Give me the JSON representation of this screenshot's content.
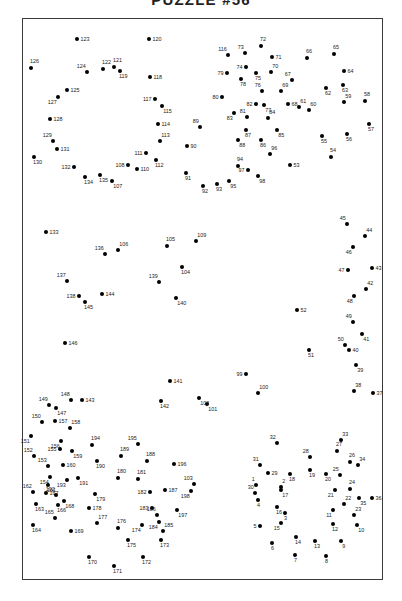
{
  "page": {
    "title": "PUZZLE #56",
    "background_color": "#ffffff",
    "frame_color": "#3a3a3a",
    "dot_color": "#000000",
    "label_color": "#1a1a1a"
  },
  "chart_data": {
    "type": "scatter",
    "title": "PUZZLE #56",
    "xlabel": "",
    "ylabel": "",
    "grid": false,
    "legend": null,
    "xlim": [
      22,
      383
    ],
    "ylim": [
      18,
      580
    ],
    "point_count": 198,
    "points": [
      {
        "n": 1,
        "x": 256,
        "y": 485,
        "pos": "tl"
      },
      {
        "n": 2,
        "x": 281,
        "y": 487,
        "pos": "tr"
      },
      {
        "n": 3,
        "x": 285,
        "y": 513,
        "pos": "b"
      },
      {
        "n": 4,
        "x": 258,
        "y": 500,
        "pos": "b"
      },
      {
        "n": 5,
        "x": 260,
        "y": 526,
        "pos": "l"
      },
      {
        "n": 6,
        "x": 272,
        "y": 543,
        "pos": "b"
      },
      {
        "n": 7,
        "x": 295,
        "y": 555,
        "pos": "b"
      },
      {
        "n": 8,
        "x": 326,
        "y": 556,
        "pos": "b"
      },
      {
        "n": 9,
        "x": 341,
        "y": 541,
        "pos": "br"
      },
      {
        "n": 10,
        "x": 357,
        "y": 525,
        "pos": "br"
      },
      {
        "n": 11,
        "x": 333,
        "y": 510,
        "pos": "bl"
      },
      {
        "n": 12,
        "x": 333,
        "y": 524,
        "pos": "b"
      },
      {
        "n": 13,
        "x": 315,
        "y": 541,
        "pos": "b"
      },
      {
        "n": 14,
        "x": 296,
        "y": 537,
        "pos": "b"
      },
      {
        "n": 15,
        "x": 281,
        "y": 523,
        "pos": "bl"
      },
      {
        "n": 16,
        "x": 277,
        "y": 507,
        "pos": "b"
      },
      {
        "n": 17,
        "x": 281,
        "y": 490,
        "pos": "br"
      },
      {
        "n": 18,
        "x": 290,
        "y": 474,
        "pos": "b"
      },
      {
        "n": 19,
        "x": 310,
        "y": 470,
        "pos": "b"
      },
      {
        "n": 20,
        "x": 326,
        "y": 474,
        "pos": "b"
      },
      {
        "n": 21,
        "x": 335,
        "y": 490,
        "pos": "bl"
      },
      {
        "n": 22,
        "x": 344,
        "y": 504,
        "pos": "tr"
      },
      {
        "n": 23,
        "x": 354,
        "y": 515,
        "pos": "tr"
      },
      {
        "n": 24,
        "x": 350,
        "y": 489,
        "pos": "t"
      },
      {
        "n": 25,
        "x": 340,
        "y": 475,
        "pos": "tl"
      },
      {
        "n": 26,
        "x": 350,
        "y": 462,
        "pos": "t"
      },
      {
        "n": 27,
        "x": 337,
        "y": 451,
        "pos": "t"
      },
      {
        "n": 28,
        "x": 310,
        "y": 457,
        "pos": "tl"
      },
      {
        "n": 29,
        "x": 268,
        "y": 473,
        "pos": "r"
      },
      {
        "n": 30,
        "x": 255,
        "y": 493,
        "pos": "tl"
      },
      {
        "n": 31,
        "x": 260,
        "y": 465,
        "pos": "tl"
      },
      {
        "n": 32,
        "x": 277,
        "y": 443,
        "pos": "tl"
      },
      {
        "n": 33,
        "x": 341,
        "y": 440,
        "pos": "tr"
      },
      {
        "n": 34,
        "x": 358,
        "y": 465,
        "pos": "tr"
      },
      {
        "n": 35,
        "x": 359,
        "y": 498,
        "pos": "br"
      },
      {
        "n": 36,
        "x": 372,
        "y": 498,
        "pos": "r"
      },
      {
        "n": 37,
        "x": 373,
        "y": 393,
        "pos": "r"
      },
      {
        "n": 38,
        "x": 354,
        "y": 391,
        "pos": "tr"
      },
      {
        "n": 39,
        "x": 356,
        "y": 365,
        "pos": "br"
      },
      {
        "n": 40,
        "x": 349,
        "y": 350,
        "pos": "r"
      },
      {
        "n": 41,
        "x": 362,
        "y": 334,
        "pos": "br"
      },
      {
        "n": 42,
        "x": 366,
        "y": 289,
        "pos": "tr"
      },
      {
        "n": 43,
        "x": 372,
        "y": 268,
        "pos": "r"
      },
      {
        "n": 44,
        "x": 365,
        "y": 236,
        "pos": "tr"
      },
      {
        "n": 45,
        "x": 347,
        "y": 224,
        "pos": "tl"
      },
      {
        "n": 46,
        "x": 353,
        "y": 247,
        "pos": "bl"
      },
      {
        "n": 47,
        "x": 348,
        "y": 270,
        "pos": "l"
      },
      {
        "n": 48,
        "x": 354,
        "y": 296,
        "pos": "bl"
      },
      {
        "n": 49,
        "x": 353,
        "y": 322,
        "pos": "tl"
      },
      {
        "n": 50,
        "x": 345,
        "y": 345,
        "pos": "tl"
      },
      {
        "n": 51,
        "x": 309,
        "y": 350,
        "pos": "b"
      },
      {
        "n": 52,
        "x": 297,
        "y": 310,
        "pos": "r"
      },
      {
        "n": 53,
        "x": 290,
        "y": 165,
        "pos": "r"
      },
      {
        "n": 54,
        "x": 331,
        "y": 157,
        "pos": "t"
      },
      {
        "n": 55,
        "x": 322,
        "y": 136,
        "pos": "b"
      },
      {
        "n": 56,
        "x": 347,
        "y": 134,
        "pos": "b"
      },
      {
        "n": 57,
        "x": 369,
        "y": 124,
        "pos": "b"
      },
      {
        "n": 58,
        "x": 365,
        "y": 101,
        "pos": "t"
      },
      {
        "n": 59,
        "x": 344,
        "y": 102,
        "pos": "tr"
      },
      {
        "n": 60,
        "x": 309,
        "y": 110,
        "pos": "tr"
      },
      {
        "n": 61,
        "x": 299,
        "y": 107,
        "pos": "tr"
      },
      {
        "n": 62,
        "x": 326,
        "y": 88,
        "pos": "b"
      },
      {
        "n": 63,
        "x": 343,
        "y": 85,
        "pos": "b"
      },
      {
        "n": 64,
        "x": 344,
        "y": 71,
        "pos": "r"
      },
      {
        "n": 65,
        "x": 334,
        "y": 54,
        "pos": "t"
      },
      {
        "n": 66,
        "x": 307,
        "y": 58,
        "pos": "t"
      },
      {
        "n": 67,
        "x": 292,
        "y": 80,
        "pos": "tl"
      },
      {
        "n": 68,
        "x": 288,
        "y": 104,
        "pos": "r"
      },
      {
        "n": 69,
        "x": 281,
        "y": 91,
        "pos": "tr"
      },
      {
        "n": 70,
        "x": 271,
        "y": 72,
        "pos": "tr"
      },
      {
        "n": 71,
        "x": 272,
        "y": 57,
        "pos": "r"
      },
      {
        "n": 72,
        "x": 261,
        "y": 46,
        "pos": "t"
      },
      {
        "n": 73,
        "x": 245,
        "y": 53,
        "pos": "tl"
      },
      {
        "n": 74,
        "x": 246,
        "y": 67,
        "pos": "l"
      },
      {
        "n": 75,
        "x": 256,
        "y": 73,
        "pos": "b"
      },
      {
        "n": 76,
        "x": 262,
        "y": 91,
        "pos": "tl"
      },
      {
        "n": 77,
        "x": 264,
        "y": 105,
        "pos": "br"
      },
      {
        "n": 78,
        "x": 241,
        "y": 79,
        "pos": "b"
      },
      {
        "n": 79,
        "x": 227,
        "y": 73,
        "pos": "l"
      },
      {
        "n": 80,
        "x": 222,
        "y": 97,
        "pos": "l"
      },
      {
        "n": 81,
        "x": 247,
        "y": 117,
        "pos": "tl"
      },
      {
        "n": 82,
        "x": 256,
        "y": 104,
        "pos": "l"
      },
      {
        "n": 83,
        "x": 234,
        "y": 113,
        "pos": "bl"
      },
      {
        "n": 84,
        "x": 268,
        "y": 118,
        "pos": "tr"
      },
      {
        "n": 85,
        "x": 277,
        "y": 130,
        "pos": "br"
      },
      {
        "n": 86,
        "x": 261,
        "y": 140,
        "pos": "b"
      },
      {
        "n": 87,
        "x": 246,
        "y": 130,
        "pos": "b"
      },
      {
        "n": 88,
        "x": 238,
        "y": 140,
        "pos": "br"
      },
      {
        "n": 89,
        "x": 200,
        "y": 127,
        "pos": "tl"
      },
      {
        "n": 90,
        "x": 187,
        "y": 146,
        "pos": "r"
      },
      {
        "n": 91,
        "x": 186,
        "y": 173,
        "pos": "b"
      },
      {
        "n": 92,
        "x": 203,
        "y": 186,
        "pos": "b"
      },
      {
        "n": 93,
        "x": 217,
        "y": 184,
        "pos": "b"
      },
      {
        "n": 94,
        "x": 238,
        "y": 166,
        "pos": "t"
      },
      {
        "n": 95,
        "x": 229,
        "y": 181,
        "pos": "br"
      },
      {
        "n": 96,
        "x": 270,
        "y": 154,
        "pos": "tr"
      },
      {
        "n": 97,
        "x": 248,
        "y": 170,
        "pos": "l"
      },
      {
        "n": 98,
        "x": 258,
        "y": 176,
        "pos": "br"
      },
      {
        "n": 99,
        "x": 246,
        "y": 374,
        "pos": "l"
      },
      {
        "n": 100,
        "x": 258,
        "y": 393,
        "pos": "tr"
      },
      {
        "n": 101,
        "x": 207,
        "y": 404,
        "pos": "br"
      },
      {
        "n": 102,
        "x": 199,
        "y": 398,
        "pos": "br"
      },
      {
        "n": 103,
        "x": 194,
        "y": 484,
        "pos": "tl"
      },
      {
        "n": 104,
        "x": 182,
        "y": 267,
        "pos": "b"
      },
      {
        "n": 105,
        "x": 167,
        "y": 246,
        "pos": "t"
      },
      {
        "n": 106,
        "x": 118,
        "y": 250,
        "pos": "tr"
      },
      {
        "n": 107,
        "x": 112,
        "y": 181,
        "pos": "br"
      },
      {
        "n": 108,
        "x": 128,
        "y": 165,
        "pos": "l"
      },
      {
        "n": 109,
        "x": 196,
        "y": 241,
        "pos": "tr"
      },
      {
        "n": 110,
        "x": 137,
        "y": 169,
        "pos": "r"
      },
      {
        "n": 111,
        "x": 146,
        "y": 153,
        "pos": "l"
      },
      {
        "n": 112,
        "x": 156,
        "y": 160,
        "pos": "b"
      },
      {
        "n": 113,
        "x": 160,
        "y": 141,
        "pos": "tr"
      },
      {
        "n": 114,
        "x": 158,
        "y": 124,
        "pos": "r"
      },
      {
        "n": 115,
        "x": 162,
        "y": 106,
        "pos": "br"
      },
      {
        "n": 116,
        "x": 228,
        "y": 55,
        "pos": "tl"
      },
      {
        "n": 117,
        "x": 155,
        "y": 99,
        "pos": "l"
      },
      {
        "n": 118,
        "x": 150,
        "y": 77,
        "pos": "r"
      },
      {
        "n": 119,
        "x": 120,
        "y": 71,
        "pos": "b"
      },
      {
        "n": 120,
        "x": 149,
        "y": 39,
        "pos": "r"
      },
      {
        "n": 121,
        "x": 114,
        "y": 67,
        "pos": "t"
      },
      {
        "n": 122,
        "x": 103,
        "y": 69,
        "pos": "t"
      },
      {
        "n": 123,
        "x": 77,
        "y": 39,
        "pos": "r"
      },
      {
        "n": 124,
        "x": 87,
        "y": 72,
        "pos": "tl"
      },
      {
        "n": 125,
        "x": 67,
        "y": 90,
        "pos": "r"
      },
      {
        "n": 126,
        "x": 31,
        "y": 68,
        "pos": "t"
      },
      {
        "n": 127,
        "x": 58,
        "y": 97,
        "pos": "bl"
      },
      {
        "n": 128,
        "x": 50,
        "y": 119,
        "pos": "r"
      },
      {
        "n": 129,
        "x": 53,
        "y": 141,
        "pos": "tl"
      },
      {
        "n": 130,
        "x": 34,
        "y": 157,
        "pos": "b"
      },
      {
        "n": 131,
        "x": 57,
        "y": 149,
        "pos": "r"
      },
      {
        "n": 132,
        "x": 74,
        "y": 167,
        "pos": "l"
      },
      {
        "n": 133,
        "x": 46,
        "y": 232,
        "pos": "r"
      },
      {
        "n": 134,
        "x": 85,
        "y": 177,
        "pos": "b"
      },
      {
        "n": 135,
        "x": 100,
        "y": 175,
        "pos": "b"
      },
      {
        "n": 136,
        "x": 105,
        "y": 254,
        "pos": "tl"
      },
      {
        "n": 137,
        "x": 67,
        "y": 281,
        "pos": "tl"
      },
      {
        "n": 138,
        "x": 79,
        "y": 296,
        "pos": "l"
      },
      {
        "n": 139,
        "x": 159,
        "y": 282,
        "pos": "tl"
      },
      {
        "n": 140,
        "x": 176,
        "y": 298,
        "pos": "br"
      },
      {
        "n": 141,
        "x": 170,
        "y": 381,
        "pos": "r"
      },
      {
        "n": 142,
        "x": 161,
        "y": 401,
        "pos": "b"
      },
      {
        "n": 143,
        "x": 82,
        "y": 400,
        "pos": "r"
      },
      {
        "n": 144,
        "x": 102,
        "y": 294,
        "pos": "r"
      },
      {
        "n": 145,
        "x": 85,
        "y": 302,
        "pos": "b"
      },
      {
        "n": 146,
        "x": 65,
        "y": 343,
        "pos": "r"
      },
      {
        "n": 147,
        "x": 56,
        "y": 408,
        "pos": "br"
      },
      {
        "n": 148,
        "x": 71,
        "y": 400,
        "pos": "tl"
      },
      {
        "n": 149,
        "x": 49,
        "y": 405,
        "pos": "tl"
      },
      {
        "n": 150,
        "x": 42,
        "y": 422,
        "pos": "tl"
      },
      {
        "n": 151,
        "x": 31,
        "y": 436,
        "pos": "bl"
      },
      {
        "n": 152,
        "x": 34,
        "y": 456,
        "pos": "tl"
      },
      {
        "n": 153,
        "x": 48,
        "y": 466,
        "pos": "tl"
      },
      {
        "n": 154,
        "x": 50,
        "y": 477,
        "pos": "bl"
      },
      {
        "n": 155,
        "x": 60,
        "y": 449,
        "pos": "l"
      },
      {
        "n": 156,
        "x": 61,
        "y": 441,
        "pos": "bl"
      },
      {
        "n": 157,
        "x": 55,
        "y": 421,
        "pos": "r"
      },
      {
        "n": 158,
        "x": 70,
        "y": 428,
        "pos": "tr"
      },
      {
        "n": 159,
        "x": 72,
        "y": 451,
        "pos": "br"
      },
      {
        "n": 160,
        "x": 63,
        "y": 465,
        "pos": "r"
      },
      {
        "n": 161,
        "x": 48,
        "y": 485,
        "pos": "b"
      },
      {
        "n": 162,
        "x": 33,
        "y": 492,
        "pos": "tl"
      },
      {
        "n": 163,
        "x": 36,
        "y": 504,
        "pos": "b"
      },
      {
        "n": 164,
        "x": 33,
        "y": 525,
        "pos": "b"
      },
      {
        "n": 165,
        "x": 55,
        "y": 518,
        "pos": "tl"
      },
      {
        "n": 166,
        "x": 58,
        "y": 505,
        "pos": "b"
      },
      {
        "n": 167,
        "x": 46,
        "y": 493,
        "pos": "r"
      },
      {
        "n": 168,
        "x": 64,
        "y": 501,
        "pos": "br"
      },
      {
        "n": 169,
        "x": 71,
        "y": 531,
        "pos": "r"
      },
      {
        "n": 170,
        "x": 89,
        "y": 557,
        "pos": "b"
      },
      {
        "n": 171,
        "x": 114,
        "y": 566,
        "pos": "b"
      },
      {
        "n": 172,
        "x": 143,
        "y": 557,
        "pos": "b"
      },
      {
        "n": 173,
        "x": 161,
        "y": 540,
        "pos": "b"
      },
      {
        "n": 174,
        "x": 142,
        "y": 525,
        "pos": "bl"
      },
      {
        "n": 175,
        "x": 128,
        "y": 540,
        "pos": "b"
      },
      {
        "n": 176,
        "x": 118,
        "y": 528,
        "pos": "t"
      },
      {
        "n": 177,
        "x": 97,
        "y": 523,
        "pos": "tr"
      },
      {
        "n": 178,
        "x": 89,
        "y": 508,
        "pos": "r"
      },
      {
        "n": 179,
        "x": 95,
        "y": 494,
        "pos": "br"
      },
      {
        "n": 180,
        "x": 118,
        "y": 478,
        "pos": "t"
      },
      {
        "n": 181,
        "x": 138,
        "y": 479,
        "pos": "t"
      },
      {
        "n": 182,
        "x": 150,
        "y": 492,
        "pos": "l"
      },
      {
        "n": 183,
        "x": 152,
        "y": 508,
        "pos": "l"
      },
      {
        "n": 184,
        "x": 159,
        "y": 522,
        "pos": "bl"
      },
      {
        "n": 185,
        "x": 163,
        "y": 531,
        "pos": "tr"
      },
      {
        "n": 186,
        "x": 157,
        "y": 515,
        "pos": "tl"
      },
      {
        "n": 187,
        "x": 165,
        "y": 490,
        "pos": "r"
      },
      {
        "n": 188,
        "x": 147,
        "y": 461,
        "pos": "t"
      },
      {
        "n": 189,
        "x": 121,
        "y": 456,
        "pos": "t"
      },
      {
        "n": 190,
        "x": 97,
        "y": 461,
        "pos": "b"
      },
      {
        "n": 191,
        "x": 78,
        "y": 478,
        "pos": "br"
      },
      {
        "n": 192,
        "x": 56,
        "y": 495,
        "pos": "tl"
      },
      {
        "n": 193,
        "x": 67,
        "y": 480,
        "pos": "bl"
      },
      {
        "n": 194,
        "x": 92,
        "y": 445,
        "pos": "t"
      },
      {
        "n": 195,
        "x": 138,
        "y": 444,
        "pos": "tl"
      },
      {
        "n": 196,
        "x": 174,
        "y": 464,
        "pos": "r"
      },
      {
        "n": 197,
        "x": 177,
        "y": 510,
        "pos": "br"
      },
      {
        "n": 198,
        "x": 191,
        "y": 491,
        "pos": "bl"
      }
    ]
  }
}
